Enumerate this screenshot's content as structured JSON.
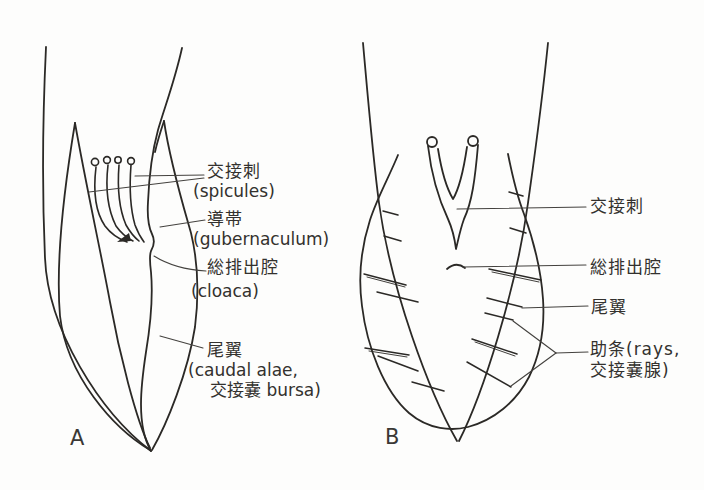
{
  "colors": {
    "ink": "#2b2926",
    "leader": "#44423f",
    "text": "#33312e",
    "background": "#fdfdfc"
  },
  "panel_a": {
    "letter": "A",
    "labels": {
      "spicules_jp": "交接刺",
      "spicules_en": "(spicules)",
      "gubernaculum_jp": "導帯",
      "gubernaculum_en": "(gubernaculum)",
      "cloaca_jp": "総排出腔",
      "cloaca_en": "(cloaca)",
      "caudal_alae_jp": "尾翼",
      "caudal_alae_en_line1": "(caudal alae,",
      "caudal_alae_en_line2": "交接嚢 bursa)"
    }
  },
  "panel_b": {
    "letter": "B",
    "labels": {
      "spicules_jp": "交接刺",
      "cloaca_jp": "総排出腔",
      "caudal_alae_jp": "尾翼",
      "rays_jp_line1": "助条(rays,",
      "rays_jp_line2": "交接嚢腺)"
    }
  }
}
